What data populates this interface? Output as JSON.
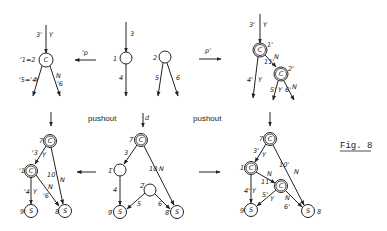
{
  "figure": {
    "label": "Fig. 8",
    "morphisms": {
      "top_left_arrow": "'p",
      "top_right_arrow": "p'",
      "middle_down": "d",
      "pushout_left": "pushout",
      "pushout_right": "pushout"
    }
  },
  "graphs": {
    "top_left": {
      "name": "'G",
      "nodes": [
        {
          "id": "c",
          "label": "C",
          "tag": "'1=2"
        }
      ],
      "edge_labels": [
        "3'",
        "Y",
        "'5='4",
        "Y",
        "N",
        "'6"
      ]
    },
    "top_middle": {
      "name": "K",
      "nodes": [
        {
          "id": "1",
          "label": "",
          "tag": "1"
        },
        {
          "id": "2",
          "label": "",
          "tag": "2"
        }
      ],
      "edge_labels": [
        "3",
        "4",
        "5",
        "6"
      ]
    },
    "top_right": {
      "name": "G'",
      "nodes": [
        {
          "id": "1p",
          "label": "C",
          "tag": "1'"
        },
        {
          "id": "2p",
          "label": "C",
          "tag": "2'"
        }
      ],
      "edge_labels": [
        "3'",
        "Y",
        "4'",
        "Y",
        "N",
        "11'",
        "5'",
        "Y",
        "6'",
        "N"
      ]
    },
    "bottom_left": {
      "name": "'H",
      "nodes": [
        {
          "id": "7",
          "label": "C",
          "tag": "7"
        },
        {
          "id": "1",
          "label": "C",
          "tag": "'1"
        },
        {
          "id": "9",
          "label": "S",
          "tag": "9"
        },
        {
          "id": "8",
          "label": "S",
          "tag": "8"
        }
      ],
      "edge_labels": [
        "'3",
        "Y",
        "10",
        "N",
        "'4",
        "Y",
        "N",
        "'6"
      ]
    },
    "bottom_middle": {
      "name": "D",
      "nodes": [
        {
          "id": "7",
          "label": "C",
          "tag": "7̄"
        },
        {
          "id": "1",
          "label": "",
          "tag": "1̄"
        },
        {
          "id": "2",
          "label": "",
          "tag": "2̄"
        },
        {
          "id": "9",
          "label": "S",
          "tag": "9̄"
        },
        {
          "id": "8",
          "label": "S",
          "tag": "8̄"
        }
      ],
      "edge_labels": [
        "3",
        "10",
        "N",
        "4",
        "5",
        "6"
      ]
    },
    "bottom_right": {
      "name": "H'",
      "nodes": [
        {
          "id": "7",
          "label": "C",
          "tag": "7"
        },
        {
          "id": "1",
          "label": "C",
          "tag": "1'"
        },
        {
          "id": "2",
          "label": "C",
          "tag": ""
        },
        {
          "id": "9",
          "label": "S",
          "tag": "9"
        },
        {
          "id": "8",
          "label": "S",
          "tag": "8"
        }
      ],
      "edge_labels": [
        "3'",
        "Y",
        "10'",
        "N",
        "N",
        "11'",
        "4'",
        "Y",
        "5'",
        "Y",
        "N",
        "6'"
      ]
    }
  }
}
